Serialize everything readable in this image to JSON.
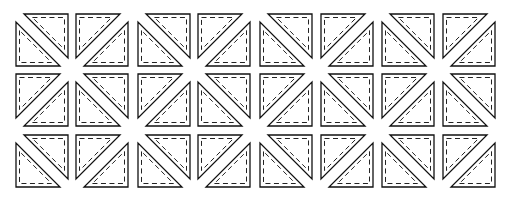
{
  "diagram": {
    "title": "",
    "colors": {
      "outline": "#111111",
      "seam": "#222222",
      "fill": "#ffffff",
      "background": "#ffffff"
    },
    "unit_size": 52,
    "gap": 8,
    "seam_inset": 3.5,
    "columns_x": [
      16,
      76,
      138,
      198,
      260,
      321,
      382,
      443
    ],
    "rows_y": [
      14,
      74,
      135
    ],
    "rows": [
      [
        "backslash",
        "slash",
        "backslash",
        "slash",
        "backslash",
        "slash",
        "backslash",
        "slash"
      ],
      [
        "slash",
        "backslash",
        "slash",
        "backslash",
        "slash",
        "backslash",
        "slash",
        "backslash"
      ],
      [
        "backslash",
        "slash",
        "backslash",
        "slash",
        "backslash",
        "slash",
        "backslash",
        "slash"
      ]
    ]
  }
}
